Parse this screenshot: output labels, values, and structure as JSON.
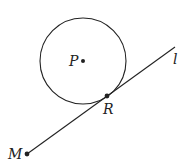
{
  "diagram": {
    "circle": {
      "center_label": "P",
      "cx": 83,
      "cy": 61,
      "r": 43
    },
    "line": {
      "label": "l",
      "x1": 27,
      "y1": 154,
      "x2": 175,
      "y2": 47
    },
    "points": [
      {
        "label": "P",
        "x": 83,
        "y": 61
      },
      {
        "label": "R",
        "x": 107,
        "y": 96
      },
      {
        "label": "M",
        "x": 27,
        "y": 154
      }
    ],
    "labels": {
      "P": "P",
      "R": "R",
      "M": "M",
      "l": "l"
    },
    "colors": {
      "stroke": "#222222",
      "background": "#ffffff"
    }
  }
}
